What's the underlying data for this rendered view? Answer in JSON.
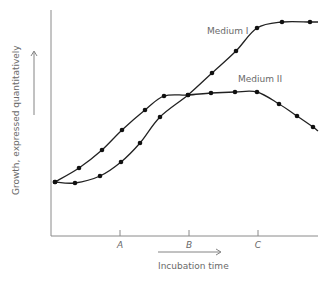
{
  "chart_data": {
    "type": "line",
    "title": "",
    "xlabel": "Incubation time",
    "ylabel": "Growth, expressed quantitatively",
    "x_ticks": [
      "A",
      "B",
      "C"
    ],
    "grid": false,
    "legend": "inline labels",
    "series": [
      {
        "name": "Medium I",
        "points_px": [
          [
            55,
            182
          ],
          [
            75,
            183
          ],
          [
            100,
            176
          ],
          [
            121,
            162
          ],
          [
            140,
            143
          ],
          [
            160,
            117
          ],
          [
            188,
            95
          ],
          [
            212,
            73
          ],
          [
            236,
            51
          ],
          [
            257,
            28
          ],
          [
            282,
            22
          ],
          [
            310,
            22
          ]
        ]
      },
      {
        "name": "Medium II",
        "points_px": [
          [
            55,
            182
          ],
          [
            79,
            168
          ],
          [
            102,
            150
          ],
          [
            122,
            130
          ],
          [
            145,
            110
          ],
          [
            164,
            96
          ],
          [
            188,
            95
          ],
          [
            211,
            93
          ],
          [
            235,
            92
          ],
          [
            257,
            92
          ],
          [
            279,
            104
          ],
          [
            297,
            116
          ],
          [
            313,
            127
          ]
        ]
      }
    ]
  },
  "labels": {
    "medium1": "Medium I",
    "medium2": "Medium II",
    "xlabel": "Incubation time",
    "ylabel": "Growth, expressed quantitatively",
    "tickA": "A",
    "tickB": "B",
    "tickC": "C"
  }
}
